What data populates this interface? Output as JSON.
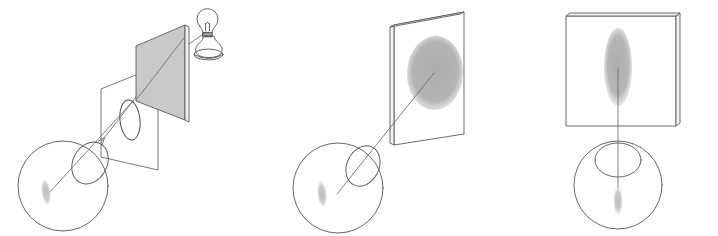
{
  "figure": {
    "background_color": "#ffffff",
    "width": 718,
    "height": 236,
    "ink_color": "#555555",
    "ray_color": "#6b6b6b",
    "blob_color": "#b2b2b2",
    "soft_blob_color": "#c6c6c6",
    "plate_gray": "#c9c9c9"
  },
  "panels": [
    {
      "id": "panel-a",
      "name": "lamp-aperture-eye-panel",
      "caption": "",
      "elements": [
        {
          "name": "light-bulb",
          "type": "lamp",
          "label": ""
        },
        {
          "name": "lamp-base",
          "type": "stand",
          "label": ""
        },
        {
          "name": "occluder-plate",
          "type": "gray-square-plate",
          "label": ""
        },
        {
          "name": "aperture-plane",
          "type": "transparent-square-plane",
          "label": ""
        },
        {
          "name": "aperture-ellipse",
          "type": "ellipse-outline",
          "label": ""
        },
        {
          "name": "chief-ray",
          "type": "arrow-ray",
          "label": ""
        },
        {
          "name": "eyeball",
          "type": "circle",
          "label": ""
        },
        {
          "name": "cornea",
          "type": "ellipse-outline",
          "label": ""
        },
        {
          "name": "retinal-image",
          "type": "soft-blob",
          "label": ""
        }
      ]
    },
    {
      "id": "panel-b",
      "name": "oblique-screen-eye-panel",
      "caption": "",
      "elements": [
        {
          "name": "screen-plate",
          "type": "white-square-plate",
          "label": ""
        },
        {
          "name": "blur-disc",
          "type": "gray-ellipse",
          "label": ""
        },
        {
          "name": "sight-line",
          "type": "ray",
          "label": ""
        },
        {
          "name": "eyeball",
          "type": "circle",
          "label": ""
        },
        {
          "name": "cornea",
          "type": "ellipse-outline",
          "label": ""
        },
        {
          "name": "retinal-image",
          "type": "soft-blob",
          "label": ""
        }
      ]
    },
    {
      "id": "panel-c",
      "name": "frontal-screen-eye-panel",
      "caption": "",
      "elements": [
        {
          "name": "screen-frame",
          "type": "square-frame",
          "label": ""
        },
        {
          "name": "blur-streak",
          "type": "vertical-gray-ellipse",
          "label": ""
        },
        {
          "name": "sight-line",
          "type": "vertical-ray",
          "label": ""
        },
        {
          "name": "eyeball",
          "type": "circle",
          "label": ""
        },
        {
          "name": "cornea",
          "type": "ellipse-outline",
          "label": ""
        },
        {
          "name": "retinal-image",
          "type": "soft-blob",
          "label": ""
        }
      ]
    }
  ]
}
